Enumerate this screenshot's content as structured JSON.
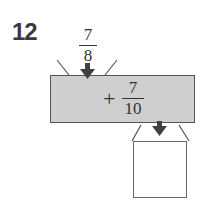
{
  "problem": {
    "number": "12",
    "input": {
      "numerator": "7",
      "denominator": "8"
    },
    "machine": {
      "operator": "+",
      "numerator": "7",
      "denominator": "10"
    },
    "output": {
      "value": ""
    }
  },
  "colors": {
    "machine_fill": "#cfcfcf",
    "arrow": "#404040"
  }
}
